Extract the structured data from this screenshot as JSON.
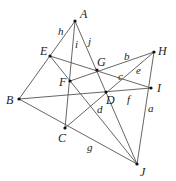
{
  "diagram": {
    "type": "geometry-configuration",
    "points": [
      {
        "name": "A",
        "x": 75,
        "y": 21,
        "lx": 80,
        "ly": 18
      },
      {
        "name": "B",
        "x": 19,
        "y": 99,
        "lx": 6,
        "ly": 104
      },
      {
        "name": "C",
        "x": 65,
        "y": 128,
        "lx": 58,
        "ly": 142
      },
      {
        "name": "D",
        "x": 106,
        "y": 92,
        "lx": 106,
        "ly": 104
      },
      {
        "name": "E",
        "x": 50,
        "y": 56,
        "lx": 40,
        "ly": 55
      },
      {
        "name": "F",
        "x": 70,
        "y": 81,
        "lx": 59,
        "ly": 86
      },
      {
        "name": "G",
        "x": 97,
        "y": 70,
        "lx": 97,
        "ly": 66
      },
      {
        "name": "H",
        "x": 154,
        "y": 52,
        "lx": 158,
        "ly": 55
      },
      {
        "name": "I",
        "x": 151,
        "y": 88,
        "lx": 157,
        "ly": 92
      },
      {
        "name": "J",
        "x": 137,
        "y": 164,
        "lx": 140,
        "ly": 176
      }
    ],
    "lines": [
      {
        "from": "A",
        "to": "B",
        "label": "h",
        "lx": 58,
        "ly": 35
      },
      {
        "from": "A",
        "to": "C",
        "label": "i",
        "lx": 75,
        "ly": 48
      },
      {
        "from": "A",
        "to": "J",
        "label": "j",
        "lx": 88,
        "ly": 45
      },
      {
        "from": "E",
        "to": "I",
        "label": "c",
        "lx": 118,
        "ly": 80
      },
      {
        "from": "F",
        "to": "H",
        "label": "b",
        "lx": 124,
        "ly": 60
      },
      {
        "from": "C",
        "to": "H",
        "label": "e",
        "lx": 136,
        "ly": 74
      },
      {
        "from": "B",
        "to": "I",
        "label": "f",
        "lx": 127,
        "ly": 103
      },
      {
        "from": "E",
        "to": "J",
        "label": "d",
        "lx": 97,
        "ly": 113
      },
      {
        "from": "B",
        "to": "J",
        "label": "g",
        "lx": 87,
        "ly": 151
      },
      {
        "from": "H",
        "to": "J",
        "label": "a",
        "lx": 148,
        "ly": 112
      }
    ]
  }
}
